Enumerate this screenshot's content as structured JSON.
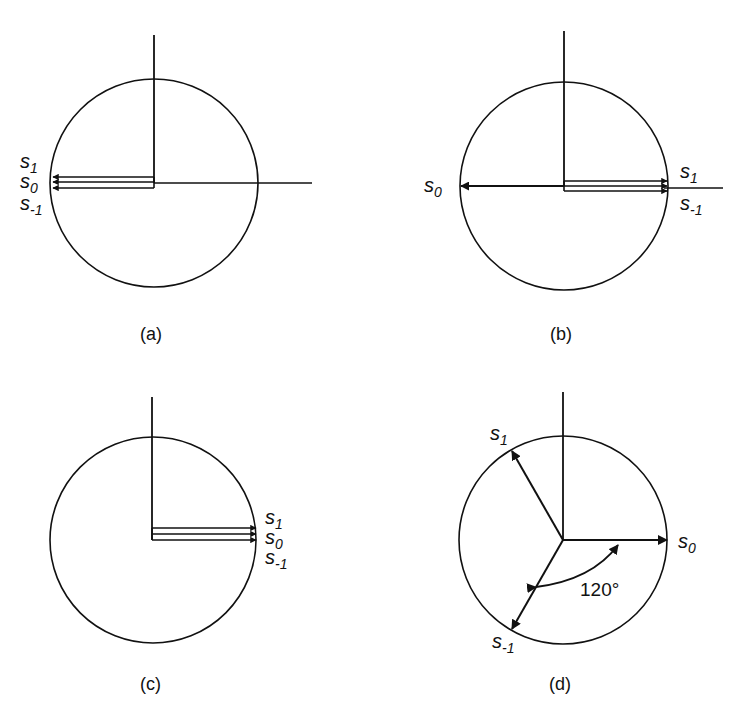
{
  "figure": {
    "panels": [
      {
        "id": "a",
        "caption": "(a)",
        "labels": [
          {
            "base": "s",
            "sub": "1"
          },
          {
            "base": "s",
            "sub": "0"
          },
          {
            "base": "s",
            "sub": "-1"
          }
        ],
        "description": "All three vectors s1, s0, s-1 aligned, pointing left (180°)"
      },
      {
        "id": "b",
        "caption": "(b)",
        "labels": [
          {
            "base": "s",
            "sub": "0"
          },
          {
            "base": "s",
            "sub": "1"
          },
          {
            "base": "s",
            "sub": "-1"
          }
        ],
        "description": "s0 points left (180°); s1 and s-1 point right (0°)"
      },
      {
        "id": "c",
        "caption": "(c)",
        "labels": [
          {
            "base": "s",
            "sub": "1"
          },
          {
            "base": "s",
            "sub": "0"
          },
          {
            "base": "s",
            "sub": "-1"
          }
        ],
        "description": "All three vectors s1, s0, s-1 aligned, pointing right (0°)"
      },
      {
        "id": "d",
        "caption": "(d)",
        "labels": [
          {
            "base": "s",
            "sub": "1"
          },
          {
            "base": "s",
            "sub": "0"
          },
          {
            "base": "s",
            "sub": "-1"
          }
        ],
        "angle_label": "120°",
        "description": "Vectors separated by 120°: s0 at 0°, s1 at 120°, s-1 at 240°"
      }
    ]
  }
}
